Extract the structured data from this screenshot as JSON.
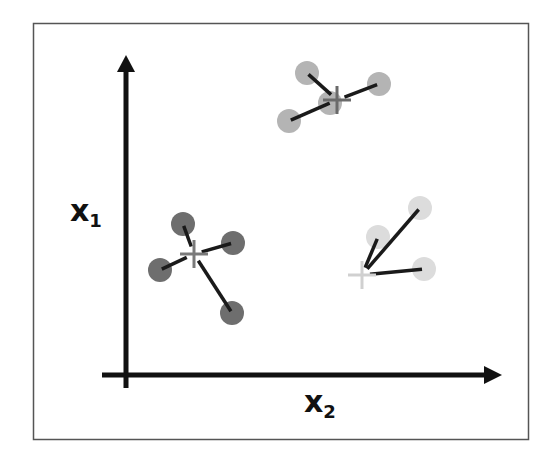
{
  "diagram": {
    "title": "",
    "axes": {
      "y_label": {
        "main": "x",
        "sub": "1"
      },
      "x_label": {
        "main": "x",
        "sub": "2"
      }
    },
    "colors": {
      "frame": "#555555",
      "axis": "#111111",
      "link": "#1a1a1a",
      "cluster_dark": "#6e6e6e",
      "cluster_mid": "#b4b4b4",
      "cluster_light": "#dcdcdc",
      "centroid_dark": "#7a7a7a",
      "centroid_mid": "#6a6a6a",
      "centroid_light": "#d0d0d0"
    },
    "clusters": [
      {
        "name": "cluster-dark",
        "shade": "dark",
        "centroid": {
          "x": 194,
          "y": 254
        },
        "points": [
          {
            "x": 183,
            "y": 224
          },
          {
            "x": 233,
            "y": 243
          },
          {
            "x": 160,
            "y": 270
          },
          {
            "x": 232,
            "y": 313
          }
        ]
      },
      {
        "name": "cluster-mid",
        "shade": "mid",
        "centroid": {
          "x": 337,
          "y": 100
        },
        "points": [
          {
            "x": 307,
            "y": 73
          },
          {
            "x": 379,
            "y": 84
          },
          {
            "x": 289,
            "y": 121
          },
          {
            "x": 330,
            "y": 103
          }
        ]
      },
      {
        "name": "cluster-light",
        "shade": "light",
        "centroid": {
          "x": 362,
          "y": 275
        },
        "points": [
          {
            "x": 420,
            "y": 208
          },
          {
            "x": 378,
            "y": 237
          },
          {
            "x": 424,
            "y": 269
          }
        ]
      }
    ]
  }
}
